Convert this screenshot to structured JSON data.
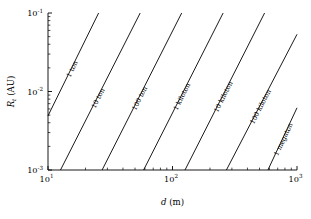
{
  "chart_data": {
    "type": "line",
    "title": "",
    "xlabel": "d (m)",
    "ylabel": "R_t (AU)",
    "xscale": "log",
    "yscale": "log",
    "xlim": [
      10,
      1000
    ],
    "ylim": [
      0.001,
      0.1
    ],
    "grid": false,
    "legend": "inline-labels-along-lines",
    "xticks": [
      {
        "value": 10,
        "label": "10",
        "exp": "1"
      },
      {
        "value": 100,
        "label": "10",
        "exp": "2"
      },
      {
        "value": 1000,
        "label": "10",
        "exp": "3"
      }
    ],
    "yticks": [
      {
        "value": 0.1,
        "label": "10",
        "exp": "-1"
      },
      {
        "value": 0.01,
        "label": "10",
        "exp": "-2"
      },
      {
        "value": 0.001,
        "label": "10",
        "exp": "-3"
      }
    ],
    "series": [
      {
        "name": "1 ton",
        "label": "1 ton",
        "points": [
          [
            10,
            0.0049
          ],
          [
            25.5,
            0.1
          ]
        ]
      },
      {
        "name": "10 ton",
        "label": "10 ton",
        "points": [
          [
            12.6,
            0.001
          ],
          [
            55.0,
            0.1
          ]
        ]
      },
      {
        "name": "100 ton",
        "label": "100 ton",
        "points": [
          [
            27.2,
            0.001
          ],
          [
            118.5,
            0.1
          ]
        ]
      },
      {
        "name": "1 kiloton",
        "label": "1 kiloton",
        "points": [
          [
            58.6,
            0.001
          ],
          [
            255.0,
            0.1
          ]
        ]
      },
      {
        "name": "10 kiloton",
        "label": "10 kiloton",
        "points": [
          [
            126.0,
            0.001
          ],
          [
            549.0,
            0.1
          ]
        ]
      },
      {
        "name": "100 kiloton",
        "label": "100 kiloton",
        "points": [
          [
            271.0,
            0.001
          ],
          [
            1000.0,
            0.0535
          ]
        ]
      },
      {
        "name": "1 megaton",
        "label": "1 megaton",
        "points": [
          [
            584.0,
            0.001
          ],
          [
            1000.0,
            0.0062
          ]
        ]
      }
    ]
  },
  "axes": {
    "x_title": "d (m)",
    "y_title_symbol": "R",
    "y_title_sub": "t",
    "y_title_unit": "(AU)"
  }
}
